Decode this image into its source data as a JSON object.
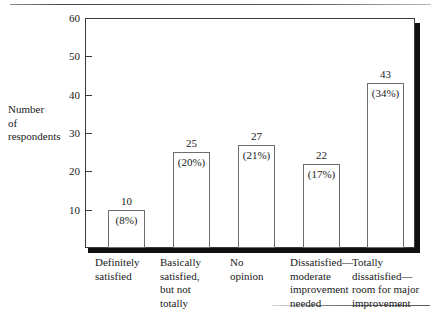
{
  "chart_data": {
    "type": "bar",
    "title": "",
    "xlabel": "",
    "ylabel": "Number of respondents",
    "ylim": [
      0,
      60
    ],
    "grid": false,
    "legend": "none",
    "categories": [
      "Definitely satisfied",
      "Basically satisfied, but not totally",
      "No opinion",
      "Dissatisfied—moderate improvement needed",
      "Totally dissatisfied—room for major improvement"
    ],
    "values": [
      10,
      25,
      27,
      22,
      43
    ],
    "percent_labels": [
      "(8%)",
      "(20%)",
      "(21%)",
      "(17%)",
      "(34%)"
    ],
    "value_labels": [
      "10",
      "25",
      "27",
      "22",
      "43"
    ],
    "yticks": [
      "10",
      "20",
      "30",
      "40",
      "50",
      "60"
    ],
    "ytick_values": [
      10,
      20,
      30,
      40,
      50,
      60
    ]
  },
  "axis": {
    "y_title_lines": [
      "Number",
      "of",
      "respondents"
    ],
    "y_title_line1": "Number",
    "y_title_line2": "of",
    "y_title_line3": "respondents",
    "ticks": [
      {
        "label": "60"
      },
      {
        "label": "50"
      },
      {
        "label": "40"
      },
      {
        "label": "30"
      },
      {
        "label": "20"
      },
      {
        "label": "10"
      }
    ]
  },
  "bars": [
    {
      "category_lines": [
        "Definitely",
        "satisfied"
      ],
      "line1": "Definitely",
      "line2": "satisfied",
      "line3": "",
      "line4": "",
      "value": "10",
      "percent": "(8%)"
    },
    {
      "category_lines": [
        "Basically",
        "satisfied,",
        "but not",
        "totally"
      ],
      "line1": "Basically",
      "line2": "satisfied,",
      "line3": "but not",
      "line4": "totally",
      "value": "25",
      "percent": "(20%)"
    },
    {
      "category_lines": [
        "No",
        "opinion"
      ],
      "line1": "No",
      "line2": "opinion",
      "line3": "",
      "line4": "",
      "value": "27",
      "percent": "(21%)"
    },
    {
      "category_lines": [
        "Dissatisfied—",
        "moderate",
        "improvement",
        "needed"
      ],
      "line1": "Dissatisfied—",
      "line2": "moderate",
      "line3": "improvement",
      "line4": "needed",
      "value": "22",
      "percent": "(17%)"
    },
    {
      "category_lines": [
        "Totally",
        "dissatisfied—",
        "room for major",
        "improvement"
      ],
      "line1": "Totally",
      "line2": "dissatisfied—",
      "line3": "room for major",
      "line4": "improvement",
      "value": "43",
      "percent": "(34%)"
    }
  ],
  "colors": {
    "axis": "#3b3b3b",
    "bar_stroke": "#6d6d6d",
    "bar_fill": "#ffffff",
    "shadow": "#101010",
    "text": "#1a1a1a"
  }
}
